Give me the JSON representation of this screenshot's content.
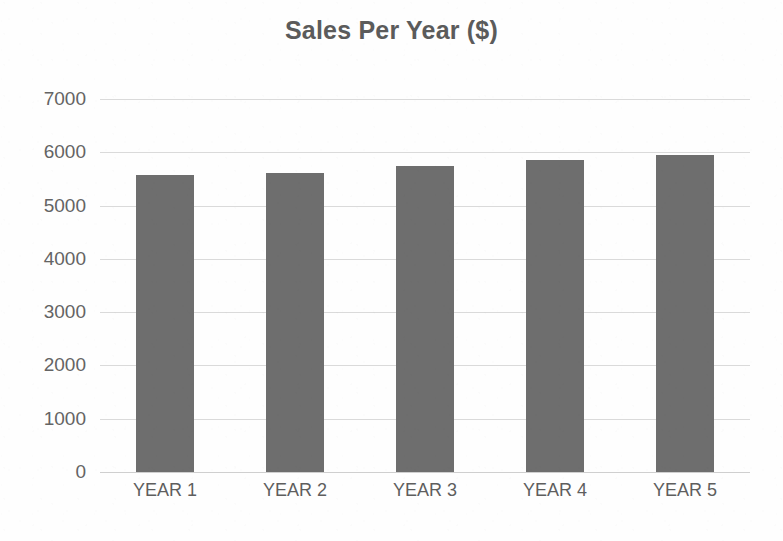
{
  "chart_data": {
    "type": "bar",
    "title": "Sales Per Year ($)",
    "xlabel": "",
    "ylabel": "",
    "categories": [
      "YEAR 1",
      "YEAR 2",
      "YEAR 3",
      "YEAR 4",
      "YEAR 5"
    ],
    "values": [
      5570,
      5610,
      5750,
      5850,
      5950
    ],
    "ylim": [
      0,
      7000
    ],
    "ytick_labels": [
      "7000",
      "6000",
      "5000",
      "4000",
      "3000",
      "2000",
      "1000",
      "0"
    ],
    "ytick_values": [
      7000,
      6000,
      5000,
      4000,
      3000,
      2000,
      1000,
      0
    ],
    "ytick_step": 1000,
    "grid": true,
    "legend": false,
    "legend_position": "none",
    "series": [
      {
        "name": "Sales",
        "values": [
          5570,
          5610,
          5750,
          5850,
          5950
        ]
      }
    ],
    "colors": {
      "bar": "#6e6e6e",
      "gridline": "#dadada",
      "baseline": "#cfcfcf",
      "title_text": "#5b5b5b",
      "tick_text": "#646464",
      "background": "#fefefe"
    }
  }
}
